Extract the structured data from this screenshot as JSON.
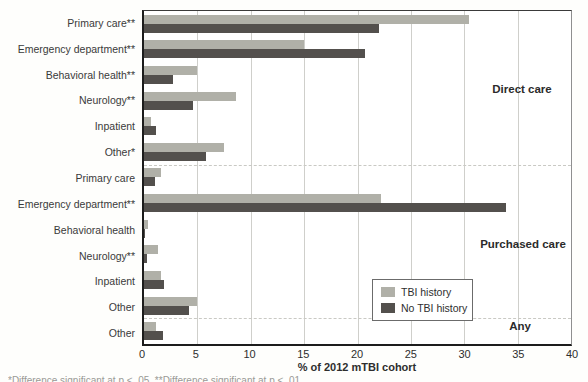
{
  "chart_data": {
    "type": "bar",
    "orientation": "horizontal",
    "xlabel": "% of 2012 mTBI cohort",
    "xlim": [
      0,
      40
    ],
    "xticks": [
      0,
      5,
      10,
      15,
      20,
      25,
      30,
      35,
      40
    ],
    "grid": "vertical-solid, dashed group separators",
    "legend_position": "inside lower-right",
    "series": [
      {
        "name": "TBI history",
        "color": "#b0b0a8"
      },
      {
        "name": "No TBI history",
        "color": "#53504d"
      }
    ],
    "groups": [
      {
        "label": "Direct care",
        "rows": [
          {
            "category": "Primary care**",
            "values": [
              30.4,
              22.0
            ]
          },
          {
            "category": "Emergency department**",
            "values": [
              15.0,
              20.7
            ]
          },
          {
            "category": "Behavioral health**",
            "values": [
              5.0,
              2.7
            ]
          },
          {
            "category": "Neurology**",
            "values": [
              8.6,
              4.6
            ]
          },
          {
            "category": "Inpatient",
            "values": [
              0.7,
              1.1
            ]
          },
          {
            "category": "Other*",
            "values": [
              7.5,
              5.8
            ]
          }
        ]
      },
      {
        "label": "Purchased care",
        "rows": [
          {
            "category": "Primary care",
            "values": [
              1.6,
              1.0
            ]
          },
          {
            "category": "Emergency department**",
            "values": [
              22.2,
              33.9
            ]
          },
          {
            "category": "Behavioral health",
            "values": [
              0.4,
              0.1
            ]
          },
          {
            "category": "Neurology**",
            "values": [
              1.3,
              0.3
            ]
          },
          {
            "category": "Inpatient",
            "values": [
              1.6,
              1.9
            ]
          },
          {
            "category": "Other",
            "values": [
              5.0,
              4.2
            ]
          }
        ]
      },
      {
        "label": "Any",
        "rows": [
          {
            "category": "Other",
            "values": [
              1.1,
              1.8
            ]
          }
        ]
      }
    ]
  },
  "footnote": "*Difference significant at p < .05. **Difference significant at p < .01."
}
